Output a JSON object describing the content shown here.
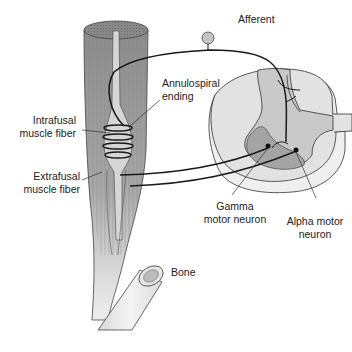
{
  "diagram": {
    "labels": {
      "afferent": "Afferent",
      "annulospiral": [
        "Annulospiral",
        "ending"
      ],
      "intrafusal": [
        "Intrafusal",
        "muscle fiber"
      ],
      "extrafusal": [
        "Extrafusal",
        "muscle fiber"
      ],
      "gamma": [
        "Gamma",
        "motor neuron"
      ],
      "alpha": [
        "Alpha motor",
        "neuron"
      ],
      "bone": "Bone"
    },
    "colors": {
      "muscle_dark": "#8f8f8f",
      "muscle_light": "#d2d2d2",
      "spinal_white_matter": "#e4e4e4",
      "spinal_gray_matter": "#c6c6c6",
      "ventral_horn_dark": "#9f9f9f",
      "bone": "#ececec",
      "nerve_line": "#1a1a1a",
      "text": "#222222"
    }
  }
}
